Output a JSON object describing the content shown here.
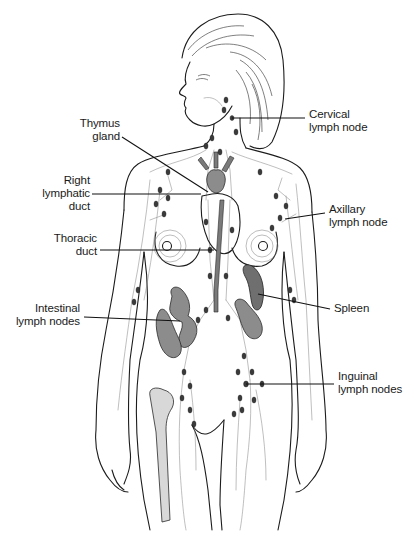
{
  "diagram": {
    "background": "#ffffff",
    "line_color": "#111111",
    "node_color": "#3a3a3a",
    "labels": [
      {
        "id": "cervical",
        "lines": [
          "Cervical",
          "lymph node"
        ],
        "align": "left",
        "x": 309,
        "y": 108,
        "leader": [
          [
            232,
            118
          ],
          [
            305,
            118
          ]
        ]
      },
      {
        "id": "thymus",
        "lines": [
          "Thymus",
          "gland"
        ],
        "align": "right",
        "x": 72,
        "y": 117,
        "leader": [
          [
            122,
            137
          ],
          [
            208,
            192
          ]
        ]
      },
      {
        "id": "right-lymphatic-duct",
        "lines": [
          "Right",
          "lymphatic",
          "duct"
        ],
        "align": "right",
        "x": 20,
        "y": 174,
        "leader": [
          [
            92,
            194
          ],
          [
            201,
            194
          ]
        ]
      },
      {
        "id": "axillary",
        "lines": [
          "Axillary",
          "lymph node"
        ],
        "align": "left",
        "x": 329,
        "y": 203,
        "leader": [
          [
            285,
            219
          ],
          [
            325,
            213
          ]
        ]
      },
      {
        "id": "thoracic-duct",
        "lines": [
          "Thoracic",
          "duct"
        ],
        "align": "right",
        "x": 45,
        "y": 232,
        "leader": [
          [
            100,
            250
          ],
          [
            214,
            250
          ]
        ]
      },
      {
        "id": "spleen",
        "lines": [
          "Spleen"
        ],
        "align": "left",
        "x": 334,
        "y": 302,
        "leader": [
          [
            258,
            294
          ],
          [
            330,
            309
          ]
        ]
      },
      {
        "id": "intestinal",
        "lines": [
          "Intestinal",
          "lymph nodes"
        ],
        "align": "right",
        "x": 18,
        "y": 302,
        "leader": [
          [
            84,
            317
          ],
          [
            180,
            321
          ]
        ]
      },
      {
        "id": "inguinal",
        "lines": [
          "Inguinal",
          "lymph nodes"
        ],
        "align": "left",
        "x": 338,
        "y": 370,
        "leader": [
          [
            246,
            384
          ],
          [
            334,
            384
          ]
        ]
      }
    ]
  }
}
